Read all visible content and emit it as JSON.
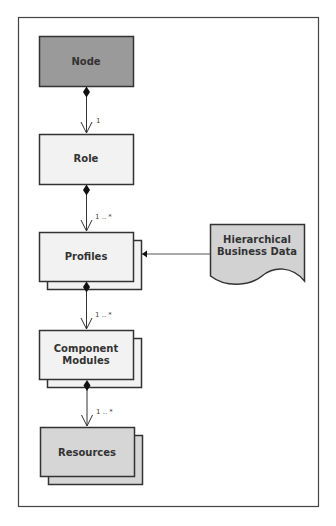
{
  "diagram": {
    "type": "uml-composition-hierarchy",
    "colors": {
      "node_fill": "#9a9a9a",
      "light_fill": "#f2f2f2",
      "resource_fill": "#d6d6d6",
      "document_fill": "#d2d2d2",
      "stroke": "#333333",
      "frame": "#444444"
    },
    "nodes": [
      {
        "id": "node",
        "label": "Node",
        "style": "dark",
        "stacked": false
      },
      {
        "id": "role",
        "label": "Role",
        "style": "light",
        "stacked": false
      },
      {
        "id": "profiles",
        "label": "Profiles",
        "style": "light",
        "stacked": true
      },
      {
        "id": "component_modules",
        "label_lines": [
          "Component",
          "Modules"
        ],
        "style": "light",
        "stacked": true
      },
      {
        "id": "resources",
        "label": "Resources",
        "style": "medium",
        "stacked": true
      }
    ],
    "document": {
      "id": "hierarchical_business_data",
      "label_lines": [
        "Hierarchical",
        "Business Data"
      ]
    },
    "edges": [
      {
        "from": "node",
        "to": "role",
        "kind": "composition",
        "multiplicity": "1"
      },
      {
        "from": "role",
        "to": "profiles",
        "kind": "composition",
        "multiplicity": "1 .. *"
      },
      {
        "from": "profiles",
        "to": "component_modules",
        "kind": "composition",
        "multiplicity": "1 .. *"
      },
      {
        "from": "component_modules",
        "to": "resources",
        "kind": "composition",
        "multiplicity": "1 .. *"
      },
      {
        "from": "hierarchical_business_data",
        "to": "profiles",
        "kind": "association",
        "multiplicity": ""
      }
    ]
  }
}
